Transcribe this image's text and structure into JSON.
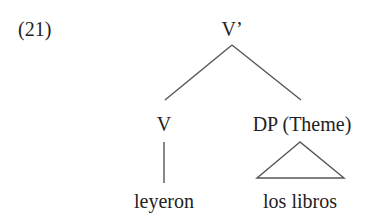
{
  "example_number": "(21)",
  "tree": {
    "root": {
      "label": "V’"
    },
    "children": [
      {
        "label": "V",
        "terminal": "leyeron",
        "connector": "line"
      },
      {
        "label": "DP (Theme)",
        "terminal": "los libros",
        "connector": "triangle"
      }
    ]
  },
  "colors": {
    "ink": "#222222",
    "branch": "#555555",
    "background": "#ffffff"
  }
}
